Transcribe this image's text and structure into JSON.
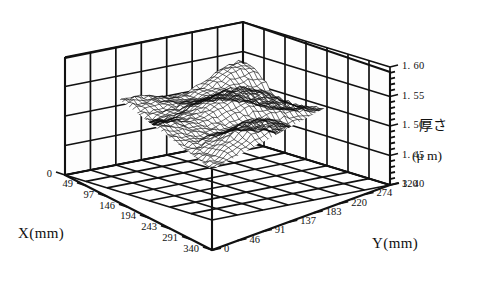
{
  "figure": {
    "name": "3d-surface-thickness-plot",
    "background_color": "#ffffff",
    "line_color": "#111111"
  },
  "chart_data": {
    "type": "surface",
    "title": "",
    "subtitle": "",
    "xlabel": "X(mm)",
    "ylabel": "Y(mm)",
    "zlabel": "厚さ",
    "zunit": "(μ m)",
    "x_ticks": [
      0,
      49,
      97,
      146,
      194,
      243,
      291,
      340
    ],
    "x_tick_labels": [
      "0",
      "49",
      "97",
      "146",
      "194",
      "243",
      "291",
      "340"
    ],
    "y_ticks": [
      0,
      46,
      91,
      137,
      183,
      220,
      274,
      320
    ],
    "y_tick_labels": [
      "0",
      "46",
      "91",
      "137",
      "183",
      "220",
      "274",
      "320"
    ],
    "z_ticks": [
      1.4,
      1.45,
      1.5,
      1.55,
      1.6
    ],
    "z_tick_labels": [
      "1. 60",
      "1. 55",
      "1. 50",
      "1. 45",
      "1. 40"
    ],
    "xlim": [
      0,
      340
    ],
    "ylim": [
      0,
      320
    ],
    "zlim": [
      1.4,
      1.6
    ],
    "grid": true,
    "legend": false,
    "mesh_rows": 38,
    "mesh_cols": 38,
    "z_mean": 1.5,
    "z_range_observed": [
      1.45,
      1.56
    ]
  },
  "axis_titles": {
    "x": "X(mm)",
    "y": "Y(mm)",
    "z_name": "厚さ",
    "z_units": "(μ m)"
  }
}
